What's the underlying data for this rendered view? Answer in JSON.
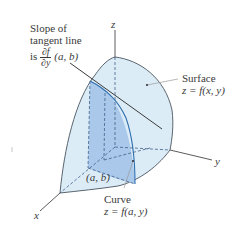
{
  "diagram": {
    "type": "3d-surface-partial-derivative",
    "colors": {
      "surface_fill": "#dcecf7",
      "slice_fill": "#a9c8ea",
      "slice_shadow": "#bcd6ef",
      "outline": "#4a5560",
      "dashed": "#3f5f86",
      "axis": "#4a4a4a"
    },
    "axes": {
      "x_label": "x",
      "y_label": "y",
      "z_label": "z"
    },
    "annotations": {
      "slope": {
        "line1": "Slope of",
        "line2": "tangent line",
        "prefix": "is",
        "frac_num": "∂f",
        "frac_den": "∂y",
        "args": "(a, b)"
      },
      "surface": {
        "title": "Surface",
        "equation": "z = f(x, y)"
      },
      "curve": {
        "title": "Curve",
        "equation": "z = f(a, y)"
      },
      "point": {
        "label": "(a, b)"
      }
    }
  }
}
